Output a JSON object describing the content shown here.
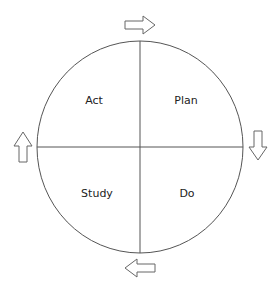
{
  "diagram": {
    "type": "PDSA cycle",
    "quadrants": [
      {
        "id": "act",
        "label": "Act",
        "position": "top-left"
      },
      {
        "id": "plan",
        "label": "Plan",
        "position": "top-right"
      },
      {
        "id": "study",
        "label": "Study",
        "position": "bottom-left"
      },
      {
        "id": "do",
        "label": "Do",
        "position": "bottom-right"
      }
    ],
    "arrows": [
      {
        "id": "top",
        "direction": "right"
      },
      {
        "id": "right",
        "direction": "down"
      },
      {
        "id": "bottom",
        "direction": "left"
      },
      {
        "id": "left",
        "direction": "up"
      }
    ],
    "colors": {
      "stroke": "#555555",
      "background": "#ffffff",
      "text": "#222222"
    }
  }
}
